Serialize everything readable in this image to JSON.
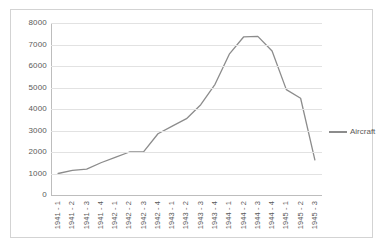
{
  "chart_data": {
    "type": "line",
    "title": "",
    "xlabel": "",
    "ylabel": "",
    "ylim": [
      0,
      8000
    ],
    "ytick_values": [
      0,
      1000,
      2000,
      3000,
      4000,
      5000,
      6000,
      7000,
      8000
    ],
    "ytick_labels": [
      "0",
      "1000",
      "2000",
      "3000",
      "4000",
      "5000",
      "6000",
      "7000",
      "8000"
    ],
    "grid": true,
    "legend_position": "right",
    "categories": [
      "1941 - 1",
      "1941 - 2",
      "1941 - 3",
      "1941 - 4",
      "1942 - 1",
      "1942 - 2",
      "1942 - 3",
      "1942 - 4",
      "1943 - 1",
      "1943 - 2",
      "1943 - 3",
      "1943 - 4",
      "1944 - 1",
      "1944 - 2",
      "1944 - 3",
      "1944 - 4",
      "1945 - 1",
      "1945 - 2",
      "1945 - 3"
    ],
    "series": [
      {
        "name": "Aircraft",
        "color": "#8c8c8c",
        "values": [
          1000,
          1150,
          1200,
          1500,
          1750,
          2000,
          2020,
          2850,
          3200,
          3550,
          4200,
          5150,
          6550,
          7350,
          7380,
          6700,
          4900,
          4500,
          1630
        ]
      }
    ]
  },
  "legend": {
    "entries": [
      {
        "label": "Aircraft"
      }
    ]
  },
  "style": {
    "line_color": "#8c8c8c",
    "grid_color": "#e2e2e2",
    "axis_color": "#bdbdbd",
    "text_color": "#5a5a5a",
    "border_color": "#d3d3d3",
    "background": "#ffffff"
  }
}
